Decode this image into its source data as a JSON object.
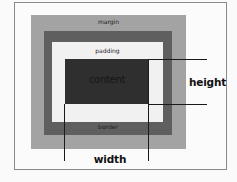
{
  "diagram": {
    "layers": {
      "margin": {
        "label": "margin",
        "color": "#a3a3a3"
      },
      "border": {
        "label": "border",
        "color": "#5f5f5f"
      },
      "padding": {
        "label": "padding",
        "color": "#f1f1f1"
      },
      "content": {
        "label": "content",
        "color": "#2f2f2f"
      }
    },
    "dimensions": {
      "height": "height",
      "width": "width"
    },
    "frame_color": "#8a8a8a",
    "line_color": "#1a1a1a"
  }
}
